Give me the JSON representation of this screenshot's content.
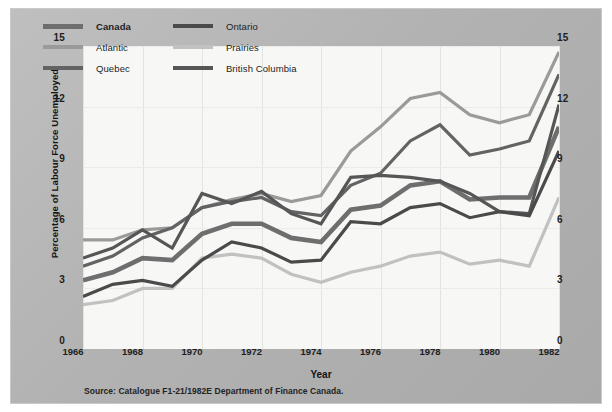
{
  "chart_data": {
    "type": "line",
    "title": "",
    "xlabel": "Year",
    "ylabel": "Percentage of Labour Force Unemployed",
    "source": "Source: Catalogue F1-21/1982E Department of Finance Canada.",
    "x": [
      1966,
      1967,
      1968,
      1969,
      1970,
      1971,
      1972,
      1973,
      1974,
      1975,
      1976,
      1977,
      1978,
      1979,
      1980,
      1981,
      1982
    ],
    "xlim": [
      1966,
      1982
    ],
    "ylim": [
      0,
      15
    ],
    "yticks": [
      0,
      3,
      6,
      9,
      12,
      15
    ],
    "xticks": [
      1966,
      1968,
      1970,
      1972,
      1974,
      1976,
      1978,
      1980,
      1982
    ],
    "grid": true,
    "legend_position": "top-left",
    "series": [
      {
        "name": "Canada",
        "color": "#6e6e6e",
        "width": 4.6,
        "bold_label": true,
        "values": [
          3.4,
          3.8,
          4.5,
          4.4,
          5.7,
          6.2,
          6.2,
          5.5,
          5.3,
          6.9,
          7.1,
          8.1,
          8.3,
          7.4,
          7.5,
          7.5,
          11.0
        ]
      },
      {
        "name": "Atlantic",
        "color": "#9a9a9a",
        "width": 3.2,
        "bold_label": false,
        "values": [
          5.4,
          5.4,
          5.9,
          6.0,
          7.0,
          7.4,
          7.7,
          7.3,
          7.6,
          9.8,
          11.0,
          12.4,
          12.7,
          11.6,
          11.2,
          11.6,
          14.7
        ]
      },
      {
        "name": "Quebec",
        "color": "#636363",
        "width": 3.2,
        "bold_label": false,
        "values": [
          4.1,
          4.6,
          5.5,
          6.0,
          7.0,
          7.3,
          7.5,
          6.8,
          6.6,
          8.1,
          8.7,
          10.3,
          11.1,
          9.6,
          9.9,
          10.3,
          13.6
        ]
      },
      {
        "name": "Ontario",
        "color": "#4a4a4a",
        "width": 3.2,
        "bold_label": false,
        "values": [
          2.6,
          3.2,
          3.4,
          3.1,
          4.4,
          5.3,
          5.0,
          4.3,
          4.4,
          6.3,
          6.2,
          7.0,
          7.2,
          6.5,
          6.8,
          6.6,
          9.8
        ]
      },
      {
        "name": "Prairies",
        "color": "#c1c1c1",
        "width": 3.2,
        "bold_label": false,
        "values": [
          2.2,
          2.4,
          3.0,
          3.0,
          4.5,
          4.7,
          4.5,
          3.7,
          3.3,
          3.8,
          4.1,
          4.6,
          4.8,
          4.2,
          4.4,
          4.1,
          7.5
        ]
      },
      {
        "name": "British Columbia",
        "color": "#565656",
        "width": 3.2,
        "bold_label": false,
        "values": [
          4.5,
          5.0,
          5.9,
          5.0,
          7.7,
          7.2,
          7.8,
          6.7,
          6.2,
          8.5,
          8.6,
          8.5,
          8.3,
          7.7,
          6.8,
          6.7,
          12.1
        ]
      }
    ]
  },
  "legend": {
    "items": [
      {
        "label": "Canada"
      },
      {
        "label": "Atlantic"
      },
      {
        "label": "Quebec"
      },
      {
        "label": "Ontario"
      },
      {
        "label": "Prairies"
      },
      {
        "label": "British Columbia"
      }
    ]
  },
  "axis": {
    "y_left": [
      "15",
      "12",
      "9",
      "6",
      "3",
      "0"
    ],
    "y_right": [
      "15",
      "12",
      "9",
      "6",
      "3",
      "0"
    ],
    "x": [
      "1966",
      "1968",
      "1970",
      "1972",
      "1974",
      "1976",
      "1978",
      "1980",
      "1982"
    ]
  }
}
